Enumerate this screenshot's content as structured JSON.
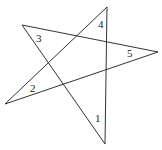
{
  "diagram": {
    "type": "pentagram",
    "stroke_color": "#333333",
    "background": "#ffffff",
    "vertices": {
      "top": [
        107,
        7
      ],
      "bottom": [
        105,
        144
      ],
      "right": [
        158,
        52
      ],
      "left": [
        5,
        104
      ],
      "upper_left": [
        22,
        25
      ]
    },
    "edges": [
      {
        "from": "upper_left",
        "to": "bottom"
      },
      {
        "from": "bottom",
        "to": "top"
      },
      {
        "from": "top",
        "to": "left"
      },
      {
        "from": "left",
        "to": "right"
      },
      {
        "from": "right",
        "to": "upper_left"
      }
    ],
    "angle_labels": [
      {
        "text": "1",
        "x": 95,
        "y": 122
      },
      {
        "text": "2",
        "x": 30,
        "y": 92
      },
      {
        "text": "3",
        "x": 36,
        "y": 42
      },
      {
        "text": "4",
        "x": 98,
        "y": 28
      },
      {
        "text": "5",
        "x": 127,
        "y": 57
      }
    ]
  }
}
